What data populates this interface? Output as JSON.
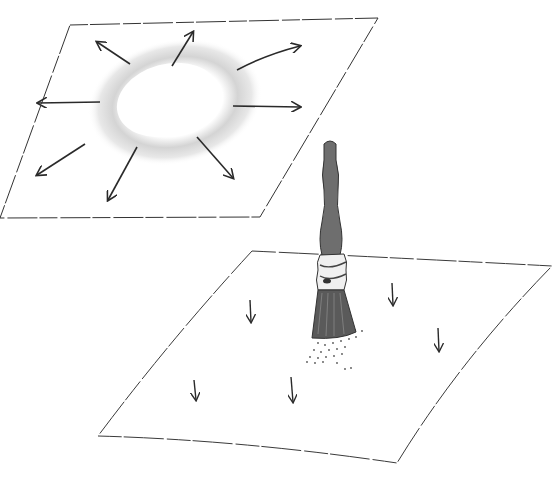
{
  "illustration": {
    "title": "",
    "panels": [
      {
        "id": "top-sheet",
        "description": "sheet with central wet/white spot; arrows radiating outward",
        "arrow_count": 8
      },
      {
        "id": "bottom-sheet",
        "description": "sheet with vertical brush dabbing; arrows pointing down",
        "arrow_count": 5
      }
    ],
    "colors": {
      "line": "#2a2a2a",
      "stain": "#d9d9d9",
      "brush_handle": "#6e6e6e",
      "ferrule": "#eeeeee",
      "bristles": "#5a5a5a"
    }
  }
}
